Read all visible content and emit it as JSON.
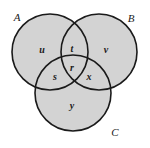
{
  "figure": {
    "name": "three-set-venn-diagram",
    "width": 150,
    "height": 148,
    "background_color": "#ffffff",
    "stroke_color": "#1a1a1a",
    "fill_color": "#d3d3d3",
    "stroke_width": 1.6
  },
  "circles": [
    {
      "set": "A",
      "cx": 50,
      "cy": 52,
      "r": 38
    },
    {
      "set": "B",
      "cx": 99,
      "cy": 52,
      "r": 38
    },
    {
      "set": "C",
      "cx": 73,
      "cy": 93,
      "r": 38
    }
  ],
  "set_labels": [
    {
      "text": "A",
      "x": 17,
      "y": 17
    },
    {
      "text": "B",
      "x": 131,
      "y": 18
    },
    {
      "text": "C",
      "x": 115,
      "y": 132
    }
  ],
  "region_labels": [
    {
      "text": "u",
      "x": 42,
      "y": 50,
      "region": "A only"
    },
    {
      "text": "t",
      "x": 72,
      "y": 49,
      "region": "A and B"
    },
    {
      "text": "v",
      "x": 106,
      "y": 50,
      "region": "B only"
    },
    {
      "text": "r",
      "x": 72,
      "y": 68,
      "region": "A and B and C"
    },
    {
      "text": "s",
      "x": 55,
      "y": 77,
      "region": "A and C"
    },
    {
      "text": "x",
      "x": 89,
      "y": 77,
      "region": "B and C"
    },
    {
      "text": "y",
      "x": 72,
      "y": 106,
      "region": "C only"
    }
  ]
}
